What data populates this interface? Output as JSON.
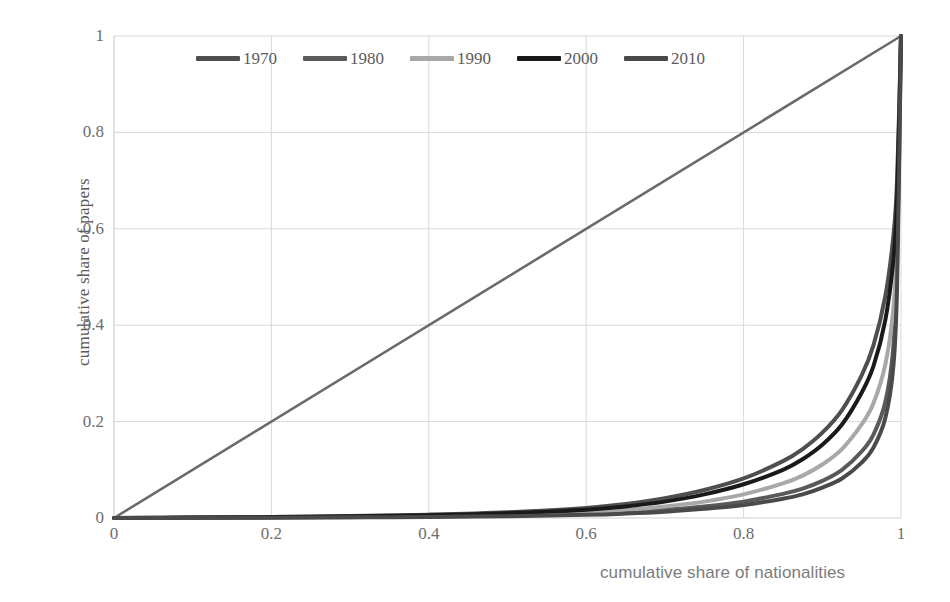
{
  "chart_data": {
    "type": "line",
    "title": "",
    "xlabel": "cumulative share of nationalities",
    "ylabel": "cumulative share of papers",
    "xlim": [
      0,
      1
    ],
    "ylim": [
      0,
      1
    ],
    "grid": true,
    "legend_position": "top-center",
    "xticks": [
      "0",
      "0.2",
      "0.4",
      "0.6",
      "0.8",
      "1"
    ],
    "yticks": [
      "0",
      "0.2",
      "0.4",
      "0.6",
      "0.8",
      "1"
    ],
    "xtick_values": [
      0,
      0.2,
      0.4,
      0.6,
      0.8,
      1
    ],
    "ytick_values": [
      0,
      0.2,
      0.4,
      0.6,
      0.8,
      1
    ],
    "annotations": [
      "line of equality (45 degree diagonal)"
    ],
    "equality_line": {
      "name": "line of equality",
      "color": "#6b6b6b",
      "x": [
        0,
        1
      ],
      "y": [
        0,
        1
      ]
    },
    "x": [
      0,
      0.1,
      0.2,
      0.3,
      0.4,
      0.5,
      0.6,
      0.65,
      0.7,
      0.75,
      0.8,
      0.85,
      0.875,
      0.9,
      0.925,
      0.95,
      0.965,
      0.98,
      0.99,
      0.995,
      1
    ],
    "series": [
      {
        "name": "1970",
        "color": "#4f4f4f",
        "values": [
          0,
          0.001,
          0.002,
          0.004,
          0.007,
          0.012,
          0.021,
          0.029,
          0.041,
          0.058,
          0.082,
          0.118,
          0.143,
          0.177,
          0.224,
          0.296,
          0.358,
          0.46,
          0.58,
          0.7,
          1
        ]
      },
      {
        "name": "1980",
        "color": "#5a5a5a",
        "values": [
          0,
          0.0004,
          0.001,
          0.0018,
          0.003,
          0.005,
          0.009,
          0.012,
          0.017,
          0.024,
          0.034,
          0.05,
          0.061,
          0.077,
          0.1,
          0.138,
          0.173,
          0.24,
          0.35,
          0.52,
          1
        ]
      },
      {
        "name": "1990",
        "color": "#a8a8a8",
        "values": [
          0,
          0.0006,
          0.0013,
          0.0024,
          0.004,
          0.0068,
          0.012,
          0.017,
          0.024,
          0.034,
          0.049,
          0.072,
          0.088,
          0.111,
          0.143,
          0.194,
          0.238,
          0.318,
          0.43,
          0.58,
          1
        ]
      },
      {
        "name": "2000",
        "color": "#1a1a1a",
        "values": [
          0,
          0.0009,
          0.0019,
          0.0034,
          0.0058,
          0.0098,
          0.017,
          0.024,
          0.034,
          0.049,
          0.07,
          0.1,
          0.122,
          0.152,
          0.194,
          0.26,
          0.315,
          0.41,
          0.53,
          0.66,
          1
        ]
      },
      {
        "name": "2010",
        "color": "#4a4a4a",
        "values": [
          0,
          0.0003,
          0.0007,
          0.0013,
          0.0022,
          0.0038,
          0.0067,
          0.0092,
          0.013,
          0.019,
          0.027,
          0.04,
          0.049,
          0.063,
          0.082,
          0.115,
          0.146,
          0.207,
          0.31,
          0.48,
          1
        ]
      }
    ]
  },
  "legend": {
    "entries": [
      {
        "label": "1970",
        "color": "#4f4f4f"
      },
      {
        "label": "1980",
        "color": "#5a5a5a"
      },
      {
        "label": "1990",
        "color": "#a8a8a8"
      },
      {
        "label": "2000",
        "color": "#1a1a1a"
      },
      {
        "label": "2010",
        "color": "#4a4a4a"
      }
    ]
  },
  "style": {
    "grid_color": "#d9d9d9",
    "axis_color": "#cfcfcf",
    "tick_label_color": "#6d6d6d",
    "background": "#ffffff"
  }
}
